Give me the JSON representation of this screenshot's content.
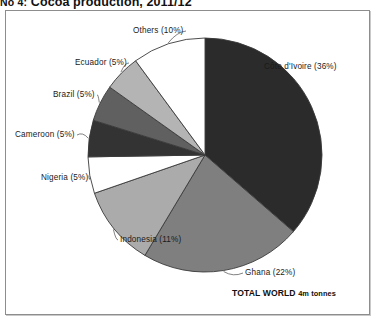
{
  "figure": {
    "number": "No 4:",
    "title": "Cocoa production, 2011/12"
  },
  "chart_data": {
    "type": "pie",
    "title": "Cocoa production, 2011/12",
    "subtitle": "",
    "xlabel": "",
    "ylabel": "",
    "legend_position": "none",
    "grid": false,
    "total_label": "TOTAL WORLD",
    "total_value": "4m tonnes",
    "unit": "percent of world production",
    "start_angle_deg": 0,
    "direction": "clockwise",
    "categories": [
      "Côte d'Ivoire",
      "Ghana",
      "Indonesia",
      "Nigeria",
      "Cameroon",
      "Brazil",
      "Ecuador",
      "Others"
    ],
    "values": [
      36,
      22,
      11,
      5,
      5,
      5,
      5,
      10
    ],
    "labels": [
      "Côte d'Ivoire (36%)",
      "Ghana (22%)",
      "Indonesia (11%)",
      "Nigeria (5%)",
      "Cameroon (5%)",
      "Brazil (5%)",
      "Ecuador (5%)",
      "Others (10%)"
    ],
    "colors": [
      "#2b2b2b",
      "#7f7f7f",
      "#ababab",
      "#ffffff",
      "#333333",
      "#606060",
      "#b4b4b4",
      "#ffffff"
    ]
  },
  "geometry": {
    "center_x": 205,
    "center_y": 155,
    "radius": 117
  },
  "colors": {
    "frame_border": "#8d8d8d",
    "slice_outline": "#3a3a3a",
    "leader_line": "#4a4a4a",
    "text": "#1a1a1a",
    "background": "#ffffff"
  },
  "label_positions": [
    {
      "name": "cote-divoire",
      "x": 264,
      "y": 62,
      "side": "right"
    },
    {
      "name": "ghana",
      "x": 245,
      "y": 268,
      "side": "right"
    },
    {
      "name": "indonesia",
      "x": 120,
      "y": 235,
      "side": "right"
    },
    {
      "name": "nigeria",
      "x": 41,
      "y": 173,
      "side": "right"
    },
    {
      "name": "cameroon",
      "x": 15,
      "y": 130,
      "side": "right"
    },
    {
      "name": "brazil",
      "x": 53,
      "y": 90,
      "side": "right"
    },
    {
      "name": "ecuador",
      "x": 75,
      "y": 58,
      "side": "right"
    },
    {
      "name": "others",
      "x": 133,
      "y": 26,
      "side": "right"
    }
  ],
  "total_note_position": {
    "x": 232,
    "y": 288
  }
}
